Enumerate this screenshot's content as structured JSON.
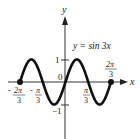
{
  "chart_data": {
    "type": "line",
    "title": "",
    "equation_label": "y = sin 3x",
    "xlabel": "x",
    "ylabel": "y",
    "function": "sin(3x)",
    "domain": [
      "-2π/3",
      "2π/3"
    ],
    "x": [
      -2.0944,
      -1.5708,
      -1.0472,
      -0.5236,
      0,
      0.5236,
      1.0472,
      1.5708,
      2.0944
    ],
    "y": [
      0,
      1,
      0,
      -1,
      0,
      1,
      0,
      -1,
      0
    ],
    "endpoints": [
      {
        "x": "-2π/3",
        "y": 0,
        "marker": "filled-dot"
      },
      {
        "x": "2π/3",
        "y": 0,
        "marker": "filled-dot"
      }
    ],
    "x_ticks": [
      {
        "label_num": "2π",
        "label_den": "3",
        "sign": "-",
        "value": -2.0944
      },
      {
        "label_num": "π",
        "label_den": "3",
        "sign": "-",
        "value": -1.0472
      },
      {
        "label_num": "π",
        "label_den": "3",
        "sign": "",
        "value": 1.0472
      },
      {
        "label_num": "2π",
        "label_den": "3",
        "sign": "",
        "value": 2.0944
      }
    ],
    "y_ticks": [
      {
        "label": "1",
        "value": 1
      },
      {
        "label": "−1",
        "value": -1
      }
    ],
    "origin_label": "0",
    "xlim": [
      -2.4,
      2.8
    ],
    "ylim": [
      -2.5,
      3.0
    ],
    "grid": false,
    "legend": null
  }
}
